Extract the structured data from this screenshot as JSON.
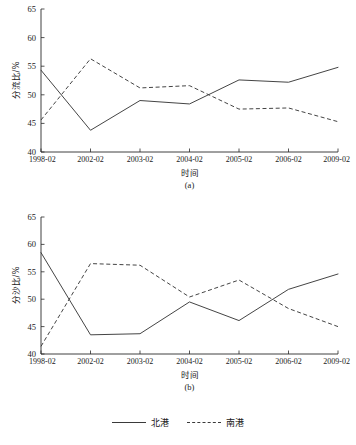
{
  "figure": {
    "width": 356,
    "height": 445
  },
  "legend": {
    "position": "bottom-center",
    "entries": [
      {
        "label": "北港",
        "style": "solid"
      },
      {
        "label": "南港",
        "style": "dashed"
      }
    ]
  },
  "chart_data": [
    {
      "type": "line",
      "panel_label": "(a)",
      "title": "",
      "xlabel": "时间",
      "ylabel": "分流比/%",
      "categories": [
        "1998-02",
        "2002-02",
        "2003-02",
        "2004-02",
        "2005-02",
        "2006-02",
        "2009-02"
      ],
      "ylim": [
        40,
        65
      ],
      "yticks": [
        40,
        45,
        50,
        55,
        60,
        65
      ],
      "grid": false,
      "legend_position": "figure-bottom",
      "series": [
        {
          "name": "北港",
          "style": "solid",
          "values": [
            54.3,
            43.8,
            49.0,
            48.4,
            52.6,
            52.2,
            54.8
          ]
        },
        {
          "name": "南港",
          "style": "dashed",
          "values": [
            45.6,
            56.3,
            51.2,
            51.6,
            47.5,
            47.7,
            45.3
          ]
        }
      ]
    },
    {
      "type": "line",
      "panel_label": "(b)",
      "title": "",
      "xlabel": "时间",
      "ylabel": "分沙比/%",
      "categories": [
        "1998-02",
        "2002-02",
        "2003-02",
        "2004-02",
        "2005-02",
        "2006-02",
        "2009-02"
      ],
      "ylim": [
        40,
        65
      ],
      "yticks": [
        40,
        45,
        50,
        55,
        60,
        65
      ],
      "grid": false,
      "legend_position": "figure-bottom",
      "series": [
        {
          "name": "北港",
          "style": "solid",
          "values": [
            58.5,
            43.5,
            43.7,
            49.5,
            46.1,
            51.8,
            54.6
          ]
        },
        {
          "name": "南港",
          "style": "dashed",
          "values": [
            41.4,
            56.5,
            56.2,
            50.4,
            53.5,
            48.3,
            45.0
          ]
        }
      ]
    }
  ]
}
